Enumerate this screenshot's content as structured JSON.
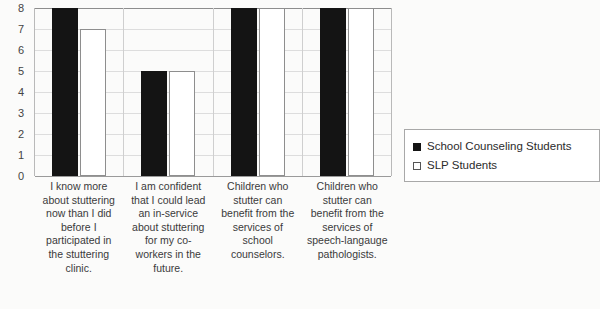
{
  "chart_data": {
    "type": "bar",
    "title": "",
    "subtitle": "",
    "xlabel": "",
    "ylabel": "",
    "ylim": [
      0,
      8
    ],
    "ytick_labels": [
      "8",
      "7",
      "6",
      "5",
      "4",
      "3",
      "2",
      "1",
      "0"
    ],
    "ytick_values": [
      8,
      7,
      6,
      5,
      4,
      3,
      2,
      1,
      0
    ],
    "grid": true,
    "legend_position": "right",
    "categories": [
      "I know more about stuttering now than I did before I participated in the stuttering clinic.",
      "I am confident that I could lead an in-service about stuttering for my co-workers in the future.",
      "Children who stutter can benefit from the services of school counselors.",
      "Children who stutter can benefit from the services of speech-langauge pathologists."
    ],
    "series": [
      {
        "name": "School Counseling Students",
        "color": "#141414",
        "values": [
          8,
          5,
          8,
          8
        ]
      },
      {
        "name": "SLP Students",
        "color": "#ffffff",
        "values": [
          7,
          5,
          8,
          8
        ]
      }
    ]
  }
}
